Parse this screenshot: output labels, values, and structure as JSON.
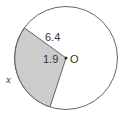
{
  "diagram": {
    "type": "circle-sector",
    "center_label": "O",
    "radius_label": "6.4",
    "angle_label": "1.9",
    "arc_label": "x",
    "colors": {
      "circle_stroke": "#555555",
      "sector_fill": "#cccccc",
      "background": "#ffffff",
      "text": "#333333"
    }
  }
}
